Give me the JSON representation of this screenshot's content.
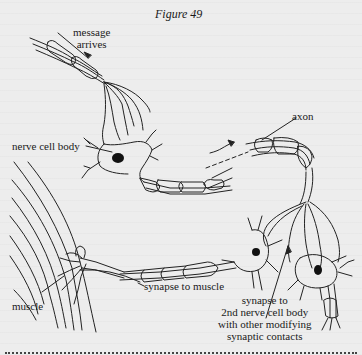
{
  "figure": {
    "title": "Figure 49",
    "labels": {
      "message_arrives": [
        "message",
        "arrives"
      ],
      "axon": "axon",
      "nerve_cell_body": "nerve cell body",
      "synapse_to_muscle": "synapse to muscle",
      "muscle": "muscle",
      "synapse_to_2nd": [
        "synapse to",
        "2nd nerve cell body",
        "with other modifying",
        "synaptic contacts"
      ]
    }
  },
  "colors": {
    "background": "#ededed",
    "ink": "#1a1a1a"
  }
}
